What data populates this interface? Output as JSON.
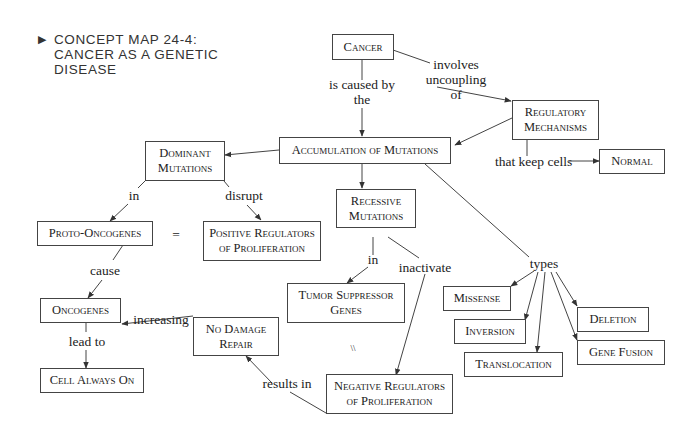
{
  "title": {
    "marker": "▶",
    "text": "CONCEPT MAP 24-4: CANCER AS A GENETIC DISEASE",
    "lines": [
      "CONCEPT MAP 24-4:",
      "CANCER AS A GENETIC",
      "DISEASE"
    ]
  },
  "nodes": {
    "cancer": "Cancer",
    "regulatory_mechanisms": [
      "Regulatory",
      "Mechanisms"
    ],
    "normal": "Normal",
    "accumulation": "Accumulation of Mutations",
    "dominant_mutations": [
      "Dominant",
      "Mutations"
    ],
    "recessive_mutations": [
      "Recessive",
      "Mutations"
    ],
    "proto_oncogenes": "Proto-Oncogenes",
    "positive_regulators": [
      "Positive Regulators",
      "of Proliferation"
    ],
    "oncogenes": "Oncogenes",
    "cell_always_on": "Cell Always On",
    "no_damage_repair": [
      "No Damage",
      "Repair"
    ],
    "tumor_suppressor": [
      "Tumor Suppressor",
      "Genes"
    ],
    "negative_regulators": [
      "Negative Regulators",
      "of Proliferation"
    ],
    "missense": "Missense",
    "inversion": "Inversion",
    "translocation": "Translocation",
    "deletion": "Deletion",
    "gene_fusion": "Gene Fusion"
  },
  "links": {
    "is_caused_by": [
      "is caused by",
      "the"
    ],
    "involves_uncoupling": [
      "involves",
      "uncoupling",
      "of"
    ],
    "that_keep_cells": "that keep cells",
    "in_dominant": "in",
    "disrupt": "disrupt",
    "equals": "=",
    "cause": "cause",
    "lead_to": "lead to",
    "increasing": "increasing",
    "in_recessive": "in",
    "inactivate": "inactivate",
    "equivalent_mark": "\\\\",
    "results_in": "results in",
    "types": "types"
  },
  "colors": {
    "line": "#444444",
    "text": "#222222",
    "background": "#ffffff"
  }
}
